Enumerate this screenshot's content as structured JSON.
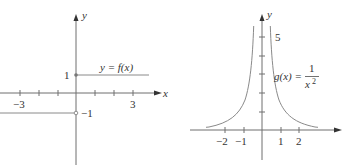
{
  "figures": [
    {
      "id": "left",
      "function_label": "y = f(x)",
      "x_axis_label": "x",
      "y_axis_label": "y",
      "x_tick_labels": [
        "−3",
        "3"
      ],
      "y_tick_labels": [
        "1",
        "−1"
      ],
      "description": "Step function: f(x) = 1 for x >= 0 (closed dot at (0,1)), f(x) = -1 for x < 0 (open circle at (0,-1))"
    },
    {
      "id": "right",
      "function_label_lhs": "g(x) =",
      "function_label_num": "1",
      "function_label_den": "x",
      "function_label_exp": "2",
      "x_axis_label": "x",
      "y_axis_label": "y",
      "x_tick_labels": [
        "−2",
        "−1",
        "1",
        "2"
      ],
      "y_tick_labels": [
        "5"
      ],
      "description": "Graph of g(x) = 1/x^2 with vertical asymptote at x = 0"
    }
  ],
  "colors": {
    "axis": "#6e6e6e",
    "curve": "#8a8a8a",
    "text": "#333333"
  }
}
